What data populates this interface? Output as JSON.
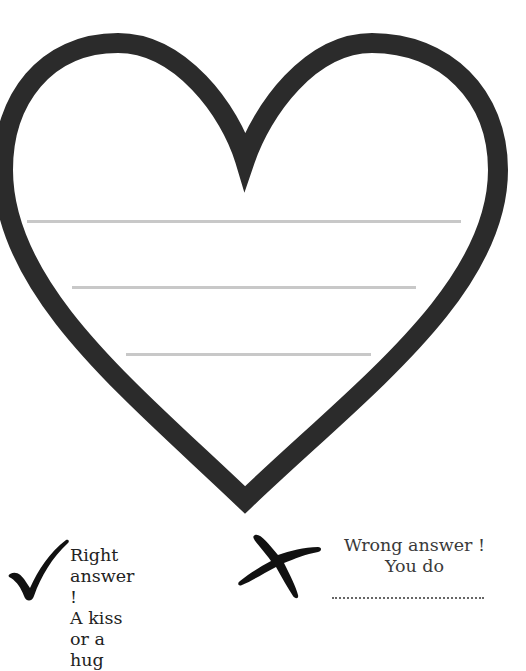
{
  "heart": {
    "outline_color": "#2b2b2b",
    "fill_color": "#ffffff",
    "writing_line_color": "#c8c8c8",
    "writing_lines": [
      {
        "x": 27,
        "y": 221,
        "width": 433
      },
      {
        "x": 72,
        "y": 287,
        "width": 344
      },
      {
        "x": 126,
        "y": 354,
        "width": 244
      }
    ]
  },
  "legend": {
    "right": {
      "icon": "check-mark-icon",
      "line1": "Right answer !",
      "line2": "A kiss or a hug"
    },
    "wrong": {
      "icon": "cross-mark-icon",
      "line1": "Wrong answer !",
      "line2": "You do",
      "blank_placeholder": "............................................"
    }
  }
}
